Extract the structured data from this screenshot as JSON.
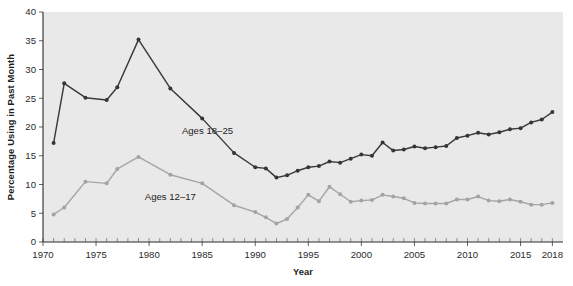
{
  "chart_data": {
    "type": "line",
    "title": "",
    "xlabel": "Year",
    "ylabel": "Percentage Using in Past Month",
    "xlim": [
      1970,
      2019
    ],
    "ylim": [
      0,
      40
    ],
    "yticks": [
      0,
      5,
      10,
      15,
      20,
      25,
      30,
      35,
      40
    ],
    "xticks": [
      1970,
      1975,
      1980,
      1985,
      1990,
      1995,
      2000,
      2005,
      2010,
      2015,
      2018
    ],
    "xtick_labels": [
      "1970",
      "1975",
      "1980",
      "1985",
      "1990",
      "1995",
      "2000",
      "2005",
      "2010",
      "2015",
      "2018"
    ],
    "ytick_labels": [
      "0",
      "5",
      "10",
      "15",
      "20",
      "25",
      "30",
      "35",
      "40"
    ],
    "grid": false,
    "legend_position": "inline-annotation",
    "plot_background": "#e9e9e9",
    "series": [
      {
        "name": "Ages 18-25",
        "label": "Ages 18–25",
        "color": "#353535",
        "label_x": 1985.5,
        "label_y": 18.7,
        "x": [
          1971,
          1972,
          1974,
          1976,
          1977,
          1979,
          1982,
          1985,
          1988,
          1990,
          1991,
          1992,
          1993,
          1994,
          1995,
          1996,
          1997,
          1998,
          1999,
          2000,
          2001,
          2002,
          2003,
          2004,
          2005,
          2006,
          2007,
          2008,
          2009,
          2010,
          2011,
          2012,
          2013,
          2014,
          2015,
          2016,
          2017,
          2018
        ],
        "y": [
          17.2,
          27.6,
          25.1,
          24.7,
          26.9,
          35.2,
          26.7,
          21.5,
          15.5,
          13.0,
          12.8,
          11.2,
          11.6,
          12.4,
          13.0,
          13.2,
          14.0,
          13.8,
          14.5,
          15.2,
          15.0,
          17.3,
          15.9,
          16.1,
          16.6,
          16.3,
          16.5,
          16.7,
          18.1,
          18.5,
          19.0,
          18.7,
          19.1,
          19.6,
          19.8,
          20.8,
          21.3,
          22.6
        ]
      },
      {
        "name": "Ages 12-17",
        "label": "Ages 12–17",
        "color": "#a3a3a3",
        "label_x": 1982.0,
        "label_y": 7.3,
        "x": [
          1971,
          1972,
          1974,
          1976,
          1977,
          1979,
          1982,
          1985,
          1988,
          1990,
          1991,
          1992,
          1993,
          1994,
          1995,
          1996,
          1997,
          1998,
          1999,
          2000,
          2001,
          2002,
          2003,
          2004,
          2005,
          2006,
          2007,
          2008,
          2009,
          2010,
          2011,
          2012,
          2013,
          2014,
          2015,
          2016,
          2017,
          2018
        ],
        "y": [
          4.8,
          6.0,
          10.5,
          10.2,
          12.7,
          14.8,
          11.7,
          10.2,
          6.4,
          5.2,
          4.3,
          3.2,
          4.0,
          6.0,
          8.2,
          7.1,
          9.6,
          8.3,
          7.0,
          7.2,
          7.3,
          8.2,
          7.9,
          7.6,
          6.8,
          6.7,
          6.7,
          6.7,
          7.4,
          7.4,
          7.9,
          7.2,
          7.1,
          7.4,
          7.0,
          6.5,
          6.5,
          6.8
        ]
      }
    ]
  }
}
